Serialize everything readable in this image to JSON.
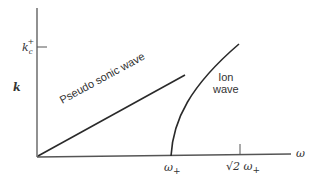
{
  "diagram": {
    "type": "dispersion-relation",
    "axes": {
      "x_label": "ω",
      "y_label": "k",
      "x_ticks": [
        {
          "label_main": "ω",
          "label_sub": "+",
          "position": "omega_plus"
        },
        {
          "label_main": "√2 ω",
          "label_sub": "+",
          "position": "sqrt2_omega_plus"
        }
      ],
      "y_ticks": [
        {
          "label_main": "k",
          "label_sub": "c",
          "label_sup": "+",
          "position": "kc_plus"
        }
      ]
    },
    "curves": [
      {
        "name": "pseudo-sonic-wave",
        "label": "Pseudo sonic wave",
        "shape": "straight line from origin"
      },
      {
        "name": "ion-wave",
        "label_line1": "Ion",
        "label_line2": "wave",
        "shape": "concave curve starting at ω+ rising toward kc+ at √2 ω+"
      }
    ],
    "colors": {
      "line": "#2a2a2a",
      "axis": "#555555",
      "text": "#333333"
    }
  }
}
